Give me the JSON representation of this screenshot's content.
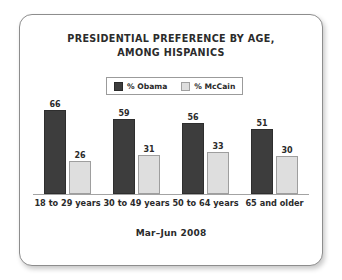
{
  "card": {
    "title_line1": "PRESIDENTIAL PREFERENCE BY AGE,",
    "title_line2": "AMONG HISPANICS",
    "footer": "Mar–Jun 2008"
  },
  "legend": {
    "entries": [
      {
        "label": "% Obama",
        "color": "#3d3d3d",
        "swatch": "obama-swatch-icon"
      },
      {
        "label": "% McCain",
        "color": "#dedede",
        "swatch": "mccain-swatch-icon"
      }
    ]
  },
  "chart_data": {
    "type": "bar",
    "title": "PRESIDENTIAL PREFERENCE BY AGE, AMONG HISPANICS",
    "subtitle": "Mar–Jun 2008",
    "xlabel": "",
    "ylabel": "",
    "ylim": [
      0,
      70
    ],
    "grid": false,
    "legend_position": "top-center",
    "categories": [
      "18 to 29 years",
      "30 to 49 years",
      "50 to 64 years",
      "65 and older"
    ],
    "series": [
      {
        "name": "% Obama",
        "color": "#3d3d3d",
        "values": [
          66,
          59,
          56,
          51
        ]
      },
      {
        "name": "% McCain",
        "color": "#dedede",
        "values": [
          26,
          31,
          33,
          30
        ]
      }
    ]
  }
}
